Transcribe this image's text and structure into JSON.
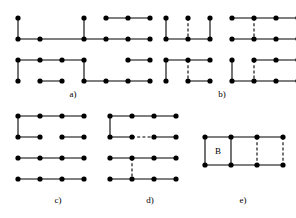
{
  "figure": {
    "title": "",
    "background_color": "#ffffff",
    "ink_color": "#000000",
    "width": 296,
    "height": 218,
    "node_radius": 2.6,
    "edge_width": 1.1,
    "dash_pattern": "3,2.2"
  },
  "chart_data": {
    "type": "diagram",
    "subtype": "grid-graph-matchings",
    "title": "",
    "panels": [
      {
        "id": "a",
        "label": "a)",
        "label_x": 73,
        "label_y": 90,
        "origin_x": 18,
        "origin_y": 18,
        "dx": 22.0,
        "dy": 21.0,
        "cols": 7,
        "rows": 4,
        "nodes": [
          [
            0,
            0
          ],
          [
            3,
            0
          ],
          [
            4,
            0
          ],
          [
            5,
            0
          ],
          [
            6,
            0
          ],
          [
            0,
            1
          ],
          [
            1,
            1
          ],
          [
            3,
            1
          ],
          [
            4,
            1
          ],
          [
            5,
            1
          ],
          [
            6,
            1
          ],
          [
            0,
            2
          ],
          [
            1,
            2
          ],
          [
            2,
            2
          ],
          [
            3,
            2
          ],
          [
            5,
            2
          ],
          [
            6,
            2
          ],
          [
            0,
            3
          ],
          [
            1,
            3
          ],
          [
            2,
            3
          ],
          [
            3,
            3
          ],
          [
            4,
            3
          ],
          [
            5,
            3
          ],
          [
            6,
            3
          ]
        ],
        "solid_edges": [
          [
            [
              0,
              0
            ],
            [
              0,
              1
            ]
          ],
          [
            [
              3,
              0
            ],
            [
              3,
              1
            ]
          ],
          [
            [
              4,
              0
            ],
            [
              5,
              0
            ]
          ],
          [
            [
              5,
              0
            ],
            [
              6,
              0
            ]
          ],
          [
            [
              0,
              1
            ],
            [
              1,
              1
            ]
          ],
          [
            [
              1,
              1
            ],
            [
              3,
              1
            ]
          ],
          [
            [
              3,
              1
            ],
            [
              4,
              1
            ]
          ],
          [
            [
              4,
              1
            ],
            [
              5,
              1
            ]
          ],
          [
            [
              5,
              1
            ],
            [
              6,
              1
            ]
          ],
          [
            [
              0,
              2
            ],
            [
              1,
              2
            ]
          ],
          [
            [
              1,
              2
            ],
            [
              2,
              2
            ]
          ],
          [
            [
              2,
              2
            ],
            [
              3,
              2
            ]
          ],
          [
            [
              5,
              2
            ],
            [
              6,
              2
            ]
          ],
          [
            [
              3,
              2
            ],
            [
              3,
              3
            ]
          ],
          [
            [
              0,
              2
            ],
            [
              0,
              3
            ]
          ],
          [
            [
              1,
              3
            ],
            [
              2,
              3
            ]
          ],
          [
            [
              3,
              3
            ],
            [
              4,
              3
            ]
          ],
          [
            [
              4,
              3
            ],
            [
              5,
              3
            ]
          ],
          [
            [
              5,
              3
            ],
            [
              6,
              3
            ]
          ]
        ],
        "dashed_edges": []
      },
      {
        "id": "b",
        "label": "b)",
        "label_x": 222,
        "label_y": 90,
        "origin_x": 166,
        "origin_y": 18,
        "dx": 22.0,
        "dy": 21.0,
        "cols": 7,
        "rows": 4,
        "nodes": [
          [
            0,
            0
          ],
          [
            1,
            0
          ],
          [
            2,
            0
          ],
          [
            3,
            0
          ],
          [
            4,
            0
          ],
          [
            5,
            0
          ],
          [
            6,
            0
          ],
          [
            0,
            1
          ],
          [
            1,
            1
          ],
          [
            2,
            1
          ],
          [
            3,
            1
          ],
          [
            4,
            1
          ],
          [
            5,
            1
          ],
          [
            6,
            1
          ],
          [
            0,
            2
          ],
          [
            1,
            2
          ],
          [
            2,
            2
          ],
          [
            3,
            2
          ],
          [
            4,
            2
          ],
          [
            5,
            2
          ],
          [
            6,
            2
          ],
          [
            0,
            3
          ],
          [
            1,
            3
          ],
          [
            2,
            3
          ],
          [
            3,
            3
          ],
          [
            4,
            3
          ],
          [
            5,
            3
          ],
          [
            6,
            3
          ]
        ],
        "solid_edges": [
          [
            [
              0,
              0
            ],
            [
              0,
              1
            ]
          ],
          [
            [
              2,
              0
            ],
            [
              2,
              1
            ]
          ],
          [
            [
              3,
              0
            ],
            [
              4,
              0
            ]
          ],
          [
            [
              4,
              0
            ],
            [
              5,
              0
            ]
          ],
          [
            [
              5,
              0
            ],
            [
              6,
              0
            ]
          ],
          [
            [
              0,
              1
            ],
            [
              1,
              1
            ]
          ],
          [
            [
              1,
              1
            ],
            [
              2,
              1
            ]
          ],
          [
            [
              3,
              1
            ],
            [
              4,
              1
            ]
          ],
          [
            [
              4,
              1
            ],
            [
              5,
              1
            ]
          ],
          [
            [
              5,
              1
            ],
            [
              6,
              1
            ]
          ],
          [
            [
              0,
              2
            ],
            [
              1,
              2
            ]
          ],
          [
            [
              1,
              2
            ],
            [
              2,
              2
            ]
          ],
          [
            [
              4,
              2
            ],
            [
              5,
              2
            ]
          ],
          [
            [
              5,
              2
            ],
            [
              6,
              2
            ]
          ],
          [
            [
              0,
              2
            ],
            [
              0,
              3
            ]
          ],
          [
            [
              3,
              2
            ],
            [
              3,
              3
            ]
          ],
          [
            [
              1,
              3
            ],
            [
              2,
              3
            ]
          ],
          [
            [
              3,
              3
            ],
            [
              4,
              3
            ]
          ],
          [
            [
              4,
              3
            ],
            [
              5,
              3
            ]
          ],
          [
            [
              5,
              3
            ],
            [
              6,
              3
            ]
          ]
        ],
        "dashed_edges": [
          [
            [
              1,
              0
            ],
            [
              1,
              1
            ]
          ],
          [
            [
              4,
              0
            ],
            [
              4,
              1
            ]
          ],
          [
            [
              1,
              2
            ],
            [
              1,
              3
            ]
          ],
          [
            [
              4,
              2
            ],
            [
              4,
              3
            ]
          ]
        ]
      },
      {
        "id": "c",
        "label": "c)",
        "label_x": 58,
        "label_y": 196,
        "origin_x": 18,
        "origin_y": 116,
        "dx": 22.0,
        "dy": 21.0,
        "cols": 5,
        "rows": 4,
        "nodes": [
          [
            0,
            0
          ],
          [
            1,
            0
          ],
          [
            2,
            0
          ],
          [
            3,
            0
          ],
          [
            0,
            1
          ],
          [
            1,
            1
          ],
          [
            2,
            1
          ],
          [
            3,
            1
          ],
          [
            0,
            2
          ],
          [
            1,
            2
          ],
          [
            2,
            2
          ],
          [
            3,
            2
          ],
          [
            0,
            3
          ],
          [
            1,
            3
          ],
          [
            2,
            3
          ],
          [
            3,
            3
          ]
        ],
        "solid_edges": [
          [
            [
              0,
              0
            ],
            [
              1,
              0
            ]
          ],
          [
            [
              1,
              0
            ],
            [
              2,
              0
            ]
          ],
          [
            [
              2,
              0
            ],
            [
              3,
              0
            ]
          ],
          [
            [
              0,
              0
            ],
            [
              0,
              1
            ]
          ],
          [
            [
              0,
              1
            ],
            [
              1,
              1
            ]
          ],
          [
            [
              2,
              1
            ],
            [
              3,
              1
            ]
          ],
          [
            [
              0,
              2
            ],
            [
              1,
              2
            ]
          ],
          [
            [
              1,
              2
            ],
            [
              2,
              2
            ]
          ],
          [
            [
              2,
              2
            ],
            [
              3,
              2
            ]
          ],
          [
            [
              0,
              3
            ],
            [
              1,
              3
            ]
          ],
          [
            [
              1,
              3
            ],
            [
              2,
              3
            ]
          ],
          [
            [
              2,
              3
            ],
            [
              3,
              3
            ]
          ]
        ],
        "dashed_edges": []
      },
      {
        "id": "d",
        "label": "d)",
        "label_x": 150,
        "label_y": 196,
        "origin_x": 110,
        "origin_y": 116,
        "dx": 22.0,
        "dy": 21.0,
        "cols": 5,
        "rows": 4,
        "nodes": [
          [
            0,
            0
          ],
          [
            1,
            0
          ],
          [
            2,
            0
          ],
          [
            3,
            0
          ],
          [
            0,
            1
          ],
          [
            1,
            1
          ],
          [
            2,
            1
          ],
          [
            3,
            1
          ],
          [
            0,
            2
          ],
          [
            1,
            2
          ],
          [
            2,
            2
          ],
          [
            3,
            2
          ],
          [
            0,
            3
          ],
          [
            1,
            3
          ],
          [
            2,
            3
          ],
          [
            3,
            3
          ]
        ],
        "solid_edges": [
          [
            [
              0,
              0
            ],
            [
              1,
              0
            ]
          ],
          [
            [
              1,
              0
            ],
            [
              2,
              0
            ]
          ],
          [
            [
              2,
              0
            ],
            [
              3,
              0
            ]
          ],
          [
            [
              0,
              0
            ],
            [
              0,
              1
            ]
          ],
          [
            [
              0,
              1
            ],
            [
              1,
              1
            ]
          ],
          [
            [
              2,
              1
            ],
            [
              3,
              1
            ]
          ],
          [
            [
              0,
              2
            ],
            [
              1,
              2
            ]
          ],
          [
            [
              1,
              2
            ],
            [
              2,
              2
            ]
          ],
          [
            [
              2,
              2
            ],
            [
              3,
              2
            ]
          ],
          [
            [
              0,
              3
            ],
            [
              1,
              3
            ]
          ],
          [
            [
              1,
              3
            ],
            [
              2,
              3
            ]
          ],
          [
            [
              2,
              3
            ],
            [
              3,
              3
            ]
          ]
        ],
        "dashed_edges": [
          [
            [
              1,
              1
            ],
            [
              2,
              1
            ]
          ],
          [
            [
              1,
              2
            ],
            [
              1,
              3
            ]
          ]
        ]
      },
      {
        "id": "e",
        "label": "e)",
        "label_x": 243,
        "label_y": 196,
        "origin_x": 205,
        "origin_y": 137,
        "dx": 26.0,
        "dy": 28.0,
        "cols": 4,
        "rows": 2,
        "nodes": [
          [
            0,
            0
          ],
          [
            1,
            0
          ],
          [
            2,
            0
          ],
          [
            3,
            0
          ],
          [
            0,
            1
          ],
          [
            1,
            1
          ],
          [
            2,
            1
          ],
          [
            3,
            1
          ]
        ],
        "solid_edges": [
          [
            [
              0,
              0
            ],
            [
              1,
              0
            ]
          ],
          [
            [
              1,
              0
            ],
            [
              2,
              0
            ]
          ],
          [
            [
              2,
              0
            ],
            [
              3,
              0
            ]
          ],
          [
            [
              0,
              1
            ],
            [
              1,
              1
            ]
          ],
          [
            [
              1,
              1
            ],
            [
              2,
              1
            ]
          ],
          [
            [
              2,
              1
            ],
            [
              3,
              1
            ]
          ],
          [
            [
              0,
              0
            ],
            [
              0,
              1
            ]
          ],
          [
            [
              1,
              0
            ],
            [
              1,
              1
            ]
          ]
        ],
        "dashed_edges": [
          [
            [
              2,
              0
            ],
            [
              2,
              1
            ]
          ],
          [
            [
              3,
              0
            ],
            [
              3,
              1
            ]
          ]
        ],
        "cell_labels": [
          {
            "text": "B",
            "cx": 0.5,
            "cy": 0.5
          }
        ]
      }
    ]
  }
}
